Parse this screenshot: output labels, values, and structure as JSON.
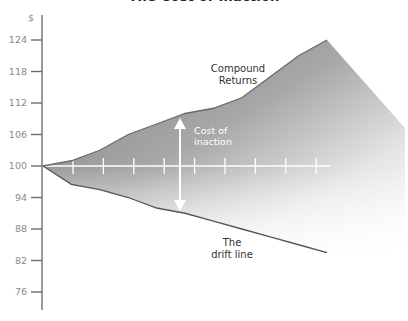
{
  "chart_data": {
    "type": "area",
    "title": "The Cost of Inaction",
    "ylabel": "$",
    "xlabel": "",
    "ylim": [
      73,
      127
    ],
    "y_ticks": [
      124,
      118,
      112,
      106,
      100,
      94,
      88,
      82,
      76
    ],
    "grid": false,
    "legend": null,
    "baseline": {
      "value": 100,
      "tick_count": 9
    },
    "series": [
      {
        "name": "Compound Returns",
        "x": [
          0,
          1,
          2,
          3,
          4,
          5,
          6,
          7,
          8,
          9,
          10
        ],
        "values": [
          100,
          101,
          103,
          106,
          108,
          110,
          111,
          113,
          117,
          121,
          124
        ]
      },
      {
        "name": "The drift line",
        "x": [
          0,
          1,
          2,
          3,
          4,
          5,
          6,
          7,
          8,
          9,
          10
        ],
        "values": [
          100,
          96.5,
          95.5,
          94,
          92,
          91,
          89.5,
          88,
          86.5,
          85,
          83.5
        ]
      }
    ],
    "annotations": [
      {
        "text": "Compound Returns",
        "target": "upper series"
      },
      {
        "text": "Cost of inaction",
        "type": "double-arrow",
        "between": [
          "Compound Returns",
          "The drift line"
        ]
      },
      {
        "text": "The drift line",
        "target": "lower series"
      }
    ]
  },
  "labels": {
    "title": "The Cost of Inaction",
    "y_unit": "$",
    "y_ticks": [
      "124",
      "118",
      "112",
      "106",
      "100",
      "94",
      "88",
      "82",
      "76"
    ],
    "compound_line1": "Compound",
    "compound_line2": "Returns",
    "cost_line1": "Cost of",
    "cost_line2": "inaction",
    "drift_line1": "The",
    "drift_line2": "drift line"
  },
  "colors": {
    "fill_dark": "#8c8c8c",
    "fill_light": "#ffffff",
    "axis": "#6e6e6e",
    "line": "#555555",
    "baseline": "#ffffff",
    "tick_label": "#8a8a8a"
  }
}
